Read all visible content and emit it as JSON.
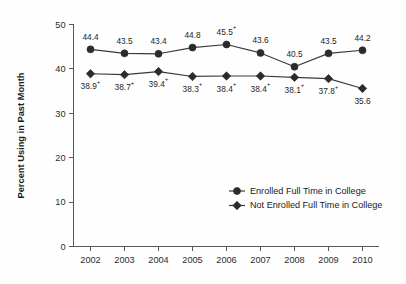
{
  "chart_data": {
    "type": "line",
    "title": "",
    "xlabel": "",
    "ylabel": "Percent Using in Past Month",
    "categories": [
      "2002",
      "2003",
      "2004",
      "2005",
      "2006",
      "2007",
      "2008",
      "2009",
      "2010"
    ],
    "ylim": [
      0,
      50
    ],
    "yticks": [
      "0",
      "10",
      "20",
      "30",
      "40",
      "50"
    ],
    "ytick_values": [
      0,
      10,
      20,
      30,
      40,
      50
    ],
    "grid": false,
    "legend_position": "lower-right",
    "series": [
      {
        "name": "Enrolled Full Time in College",
        "marker": "circle",
        "label_position": "above",
        "values": [
          44.4,
          43.5,
          43.4,
          44.8,
          45.5,
          43.6,
          40.5,
          43.5,
          44.2
        ],
        "point_labels": [
          "44.4",
          "43.5",
          "43.4",
          "44.8",
          "45.5",
          "43.6",
          "40.5",
          "43.5",
          "44.2"
        ],
        "significance_markers": [
          "",
          "",
          "",
          "",
          "+",
          "",
          "",
          "",
          ""
        ]
      },
      {
        "name": "Not Enrolled Full Time in College",
        "marker": "diamond",
        "label_position": "below",
        "values": [
          38.9,
          38.7,
          39.4,
          38.3,
          38.4,
          38.4,
          38.1,
          37.8,
          35.6
        ],
        "point_labels": [
          "38.9",
          "38.7",
          "39.4",
          "38.3",
          "38.4",
          "38.4",
          "38.1",
          "37.8",
          "35.6"
        ],
        "significance_markers": [
          "+",
          "+",
          "+",
          "+",
          "+",
          "+",
          "+",
          "+",
          ""
        ]
      }
    ]
  },
  "legend": {
    "entries": [
      {
        "label": "Enrolled Full Time in College",
        "marker": "circle"
      },
      {
        "label": "Not Enrolled Full Time in College",
        "marker": "diamond"
      }
    ]
  },
  "colors": {
    "marker": "#2b2b2d",
    "line": "#3a3a3c",
    "axis": "#555a5e",
    "text": "#1d1d1d",
    "background": "#fefefe"
  }
}
